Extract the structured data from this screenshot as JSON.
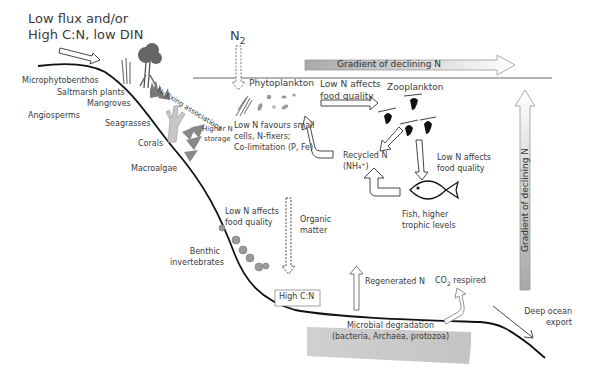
{
  "input": {
    "line1": "Low flux and/or",
    "line2": "High C:N, low DIN"
  },
  "n2": {
    "symbol": "N",
    "sub": "2"
  },
  "gradient_horizontal": "Gradient of declining N",
  "gradient_vertical": "Gradient of declining N",
  "coastal": {
    "microphytobenthos": "Microphytobenthos",
    "saltmarsh": "Saltmarsh plants",
    "mangroves": "Mangroves",
    "angiosperms": "Angiosperms",
    "seagrasses": "Seagrasses",
    "corals": "Corals",
    "macroalgae": "Macroalgae",
    "n_fixing": "N₂ fixing associations",
    "higher_n_1": "Higher N",
    "higher_n_2": "storage"
  },
  "phyto": {
    "title": "Phytoplankton",
    "note1": "Low N favours small",
    "note2": "cells, N-fixers;",
    "note3": "Co-limitation (P, Fe)"
  },
  "food_quality_top": {
    "line1": "Low N affects",
    "line2": "food quality"
  },
  "zoo": {
    "title": "Zooplankton"
  },
  "recycled": {
    "line1": "Recycled N",
    "line2": "(NH₄⁺)"
  },
  "food_quality_right": {
    "line1": "Low N affects",
    "line2": "food quality"
  },
  "fish": {
    "line1": "Fish, higher",
    "line2": "trophic levels"
  },
  "food_quality_benthic": {
    "line1": "Low N affects",
    "line2": "food quality"
  },
  "organic": {
    "line1": "Organic",
    "line2": "matter"
  },
  "benthic": {
    "line1": "Benthic",
    "line2": "invertebrates"
  },
  "high_cn": "High C:N",
  "regenerated": "Regenerated N",
  "co2": {
    "pre": "CO",
    "sub": "2",
    "post": " respired"
  },
  "microbial": {
    "line1": "Microbial degradation",
    "line2": "(bacteria, Archaea, protozoa)"
  },
  "deep": {
    "line1": "Deep ocean",
    "line2": "export"
  }
}
